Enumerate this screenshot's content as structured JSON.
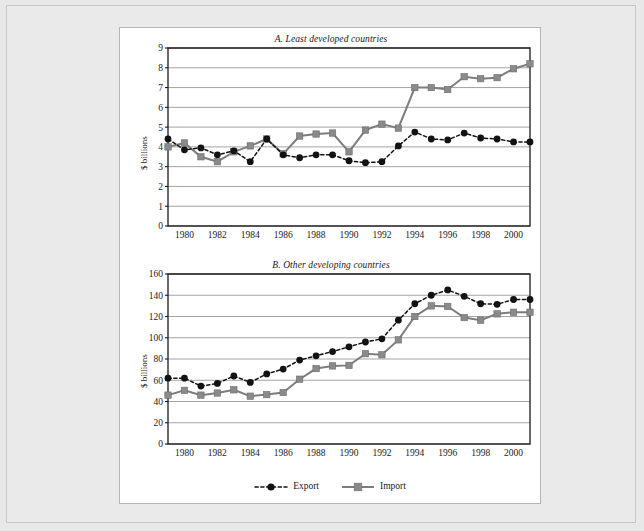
{
  "figure": {
    "background_color": "#eaeaea",
    "panel_color": "#ffffff"
  },
  "legend": {
    "position": "bottom-center",
    "entries": [
      {
        "label": "Export",
        "marker": "circle-marker",
        "style": "dashed",
        "color": "#121212"
      },
      {
        "label": "Import",
        "marker": "square-marker",
        "style": "solid",
        "color": "#8a8a8a"
      }
    ]
  },
  "chart_data": [
    {
      "id": "chart-a",
      "type": "line",
      "title": "A. Least developed countries",
      "xlabel": "",
      "ylabel": "$ billions",
      "ylim": [
        0,
        9
      ],
      "ytick_step": 1,
      "ytick_labels": [
        "0",
        "1",
        "2",
        "3",
        "4",
        "5",
        "6",
        "7",
        "8",
        "9"
      ],
      "grid": true,
      "xlim": [
        1979,
        2001
      ],
      "x": [
        1979,
        1980,
        1981,
        1982,
        1983,
        1984,
        1985,
        1986,
        1987,
        1988,
        1989,
        1990,
        1991,
        1992,
        1993,
        1994,
        1995,
        1996,
        1997,
        1998,
        1999,
        2000,
        2001
      ],
      "xtick_labels": [
        "1980",
        "1982",
        "1984",
        "1986",
        "1988",
        "1990",
        "1992",
        "1994",
        "1996",
        "1998",
        "2000"
      ],
      "xticks": [
        1980,
        1982,
        1984,
        1986,
        1988,
        1990,
        1992,
        1994,
        1996,
        1998,
        2000
      ],
      "series": [
        {
          "name": "Export",
          "values": [
            4.4,
            3.85,
            3.95,
            3.6,
            3.8,
            3.25,
            4.4,
            3.6,
            3.45,
            3.6,
            3.6,
            3.3,
            3.2,
            3.25,
            4.05,
            4.75,
            4.4,
            4.35,
            4.7,
            4.45,
            4.4,
            4.25,
            4.25
          ]
        },
        {
          "name": "Import",
          "values": [
            4.0,
            4.2,
            3.5,
            3.25,
            3.75,
            4.05,
            4.4,
            3.65,
            4.55,
            4.65,
            4.7,
            3.75,
            4.85,
            5.15,
            4.95,
            7.0,
            7.0,
            6.9,
            7.55,
            7.45,
            7.5,
            7.95,
            8.2
          ]
        }
      ]
    },
    {
      "id": "chart-b",
      "type": "line",
      "title": "B. Other developing countries",
      "xlabel": "",
      "ylabel": "$ billions",
      "ylim": [
        0,
        160
      ],
      "ytick_step": 20,
      "ytick_labels": [
        "0",
        "20",
        "40",
        "60",
        "80",
        "100",
        "120",
        "140",
        "160"
      ],
      "grid": true,
      "xlim": [
        1979,
        2001
      ],
      "x": [
        1979,
        1980,
        1981,
        1982,
        1983,
        1984,
        1985,
        1986,
        1987,
        1988,
        1989,
        1990,
        1991,
        1992,
        1993,
        1994,
        1995,
        1996,
        1997,
        1998,
        1999,
        2000,
        2001
      ],
      "xtick_labels": [
        "1980",
        "1982",
        "1984",
        "1986",
        "1988",
        "1990",
        "1992",
        "1994",
        "1996",
        "1998",
        "2000"
      ],
      "xticks": [
        1980,
        1982,
        1984,
        1986,
        1988,
        1990,
        1992,
        1994,
        1996,
        1998,
        2000
      ],
      "series": [
        {
          "name": "Export",
          "values": [
            62,
            62,
            54.5,
            57,
            64,
            58,
            66,
            70.5,
            79,
            83,
            87,
            91.5,
            96,
            99,
            116.5,
            132,
            140,
            145,
            139,
            132,
            131.5,
            136,
            136
          ]
        },
        {
          "name": "Import",
          "values": [
            46,
            50.5,
            46,
            48,
            51,
            45,
            46.5,
            48.5,
            61,
            71,
            73.5,
            74,
            85,
            84,
            98,
            120,
            130,
            129.5,
            119,
            116.5,
            122.5,
            124,
            124
          ]
        }
      ]
    }
  ]
}
